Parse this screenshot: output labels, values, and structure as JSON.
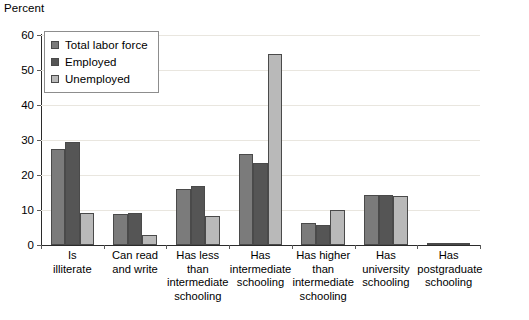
{
  "chart_data": {
    "type": "bar",
    "title": "",
    "subtitle": "",
    "xlabel": "",
    "ylabel": "Percent",
    "ylim": [
      0,
      60
    ],
    "yticks": [
      0,
      10,
      20,
      30,
      40,
      50,
      60
    ],
    "grid": true,
    "grid_axis": "y",
    "legend_position": "top-left-inside",
    "categories": [
      "Is\nilliterate",
      "Can read\nand write",
      "Has less\nthan\nintermediate\nschooling",
      "Has\nintermediate\nschooling",
      "Has higher\nthan\nintermediate\nschooling",
      "Has\nuniversity\nschooling",
      "Has\npostgraduate\nschooling"
    ],
    "series": [
      {
        "name": "Total labor force",
        "color": "#7b7b7b",
        "values": [
          27.3,
          9.0,
          16.1,
          26.0,
          6.3,
          14.2,
          0.4
        ]
      },
      {
        "name": "Employed",
        "color": "#555555",
        "values": [
          29.3,
          9.1,
          17.0,
          23.4,
          5.7,
          14.2,
          0.5
        ]
      },
      {
        "name": "Unemployed",
        "color": "#b9b9b9",
        "values": [
          9.2,
          3.0,
          8.4,
          54.5,
          9.9,
          13.9,
          0.2
        ]
      }
    ]
  }
}
